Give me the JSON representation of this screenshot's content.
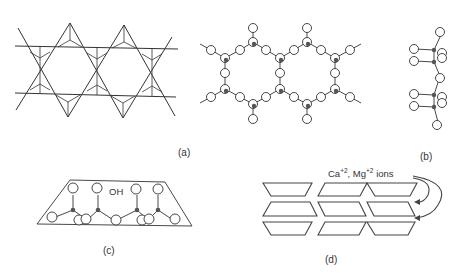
{
  "figure": {
    "panels": [
      {
        "id": "a",
        "label": "(a)",
        "description": "Tetrahedral sheet (star/hexagonal net) and ring-linked silicate chain network"
      },
      {
        "id": "b",
        "label": "(b)",
        "description": "Side view of chain"
      },
      {
        "id": "c",
        "label": "(c)",
        "description": "Layer with OH",
        "annotation": "OH"
      },
      {
        "id": "d",
        "label": "(d)",
        "description": "Stacked layers with interlayer ions",
        "annotation": {
          "ion1": "Ca",
          "ion1_charge": "+2",
          "separator": ", ",
          "ion2": "Mg",
          "ion2_charge": "+2",
          "suffix": "ions"
        }
      }
    ]
  },
  "colors": {
    "line": "#333333",
    "atom_fill": "#ffffff",
    "center_fill": "#555555"
  }
}
